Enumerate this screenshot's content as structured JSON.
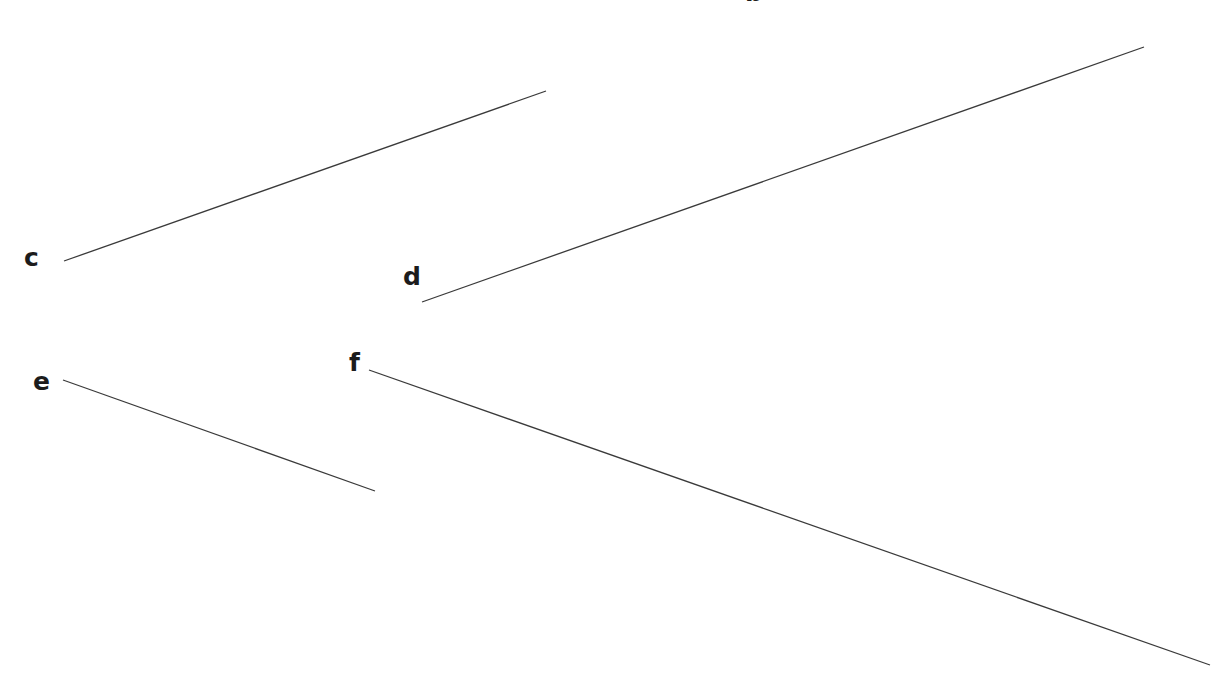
{
  "diagram": {
    "background": "#ffffff",
    "line_color": "#3a3a3a",
    "label_color": "#1c1c1c",
    "labels": [
      {
        "id": "b",
        "text": "b",
        "x": 745,
        "y": -20
      },
      {
        "id": "c",
        "text": "c",
        "x": 24,
        "y": 245
      },
      {
        "id": "d",
        "text": "d",
        "x": 403,
        "y": 264
      },
      {
        "id": "e",
        "text": "e",
        "x": 33,
        "y": 369
      },
      {
        "id": "f",
        "text": "f",
        "x": 349,
        "y": 350
      }
    ],
    "segments": [
      {
        "id": "c",
        "x1": 64,
        "y1": 261,
        "x2": 546,
        "y2": 91
      },
      {
        "id": "d",
        "x1": 422,
        "y1": 302,
        "x2": 1144,
        "y2": 47
      },
      {
        "id": "e",
        "x1": 63,
        "y1": 380,
        "x2": 375,
        "y2": 491
      },
      {
        "id": "f",
        "x1": 369,
        "y1": 370,
        "x2": 1210,
        "y2": 665
      }
    ]
  }
}
